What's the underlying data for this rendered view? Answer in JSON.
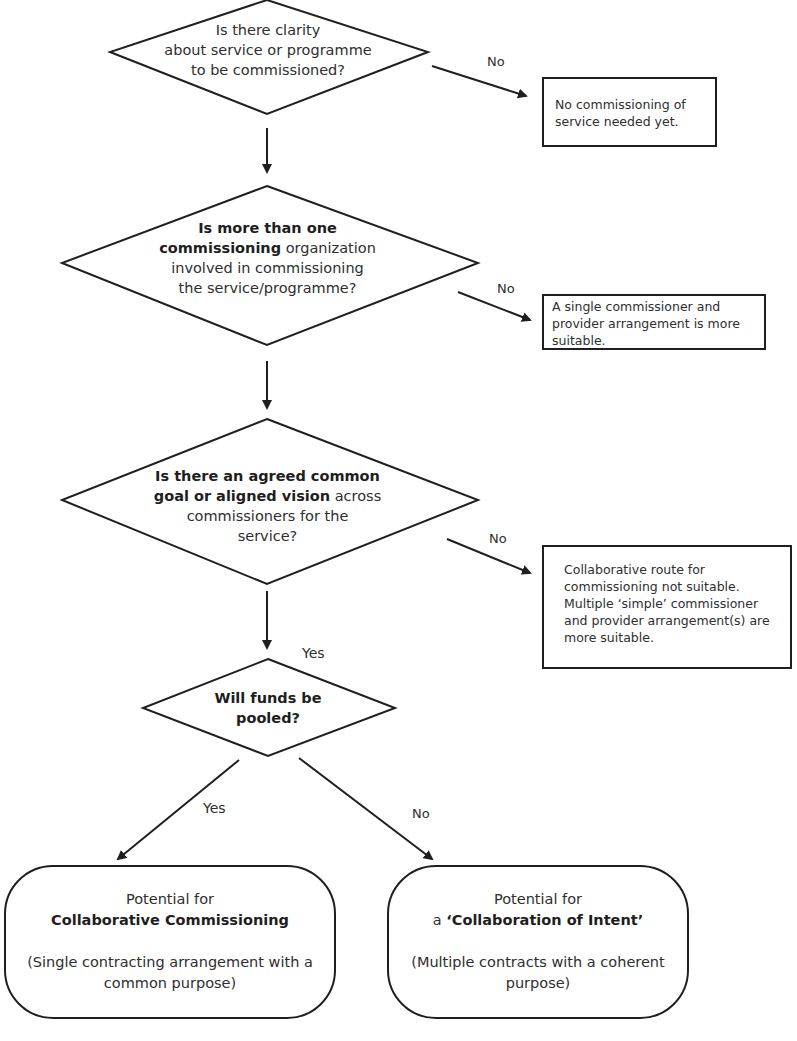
{
  "decisions": [
    {
      "id": "d1",
      "lines": [
        [
          {
            "text": "Is there clarity",
            "bold": false
          }
        ],
        [
          {
            "text": "about service or programme",
            "bold": false
          }
        ],
        [
          {
            "text": "to be commissioned?",
            "bold": false
          }
        ]
      ]
    },
    {
      "id": "d2",
      "lines": [
        [
          {
            "text": "Is more than one",
            "bold": true
          }
        ],
        [
          {
            "text": "commissioning",
            "bold": true
          },
          {
            "text": " organization",
            "bold": false
          }
        ],
        [
          {
            "text": "involved in commissioning",
            "bold": false
          }
        ],
        [
          {
            "text": "the service/programme?",
            "bold": false
          }
        ]
      ]
    },
    {
      "id": "d3",
      "lines": [
        [
          {
            "text": "Is there an agreed common",
            "bold": true
          }
        ],
        [
          {
            "text": "goal or aligned vision",
            "bold": true
          },
          {
            "text": " across",
            "bold": false
          }
        ],
        [
          {
            "text": "commissioners for the",
            "bold": false
          }
        ],
        [
          {
            "text": "service?",
            "bold": false
          }
        ]
      ]
    },
    {
      "id": "d4",
      "lines": [
        [
          {
            "text": "Will funds be",
            "bold": true
          }
        ],
        [
          {
            "text": "pooled?",
            "bold": true
          }
        ]
      ]
    }
  ],
  "outcome_boxes": [
    {
      "id": "b1",
      "lines": [
        "No commissioning of",
        "service needed yet."
      ]
    },
    {
      "id": "b2",
      "lines": [
        "A single commissioner and",
        "provider arrangement is more",
        "suitable."
      ]
    },
    {
      "id": "b3",
      "lines": [
        "Collaborative route for",
        "commissioning not suitable.",
        "Multiple ‘simple’ commissioner",
        "and provider arrangement(s) are",
        "more suitable."
      ]
    }
  ],
  "edge_labels": {
    "d1_no": "No",
    "d2_no": "No",
    "d3_no": "No",
    "d3_yes": "Yes",
    "d4_yes": "Yes",
    "d4_no": "No"
  },
  "terminals": [
    {
      "id": "t1",
      "intro": "Potential for",
      "title_prefix": "",
      "title": "Collaborative Commissioning",
      "detail": [
        "(Single contracting arrangement with a",
        "common purpose)"
      ]
    },
    {
      "id": "t2",
      "intro": "Potential for",
      "title_prefix": "a ",
      "title": "‘Collaboration of Intent’",
      "detail": [
        "(Multiple contracts with a coherent",
        "purpose)"
      ]
    }
  ],
  "colors": {
    "stroke": "#1f1f1f",
    "text": "#2e2e2e",
    "background": "#ffffff"
  }
}
